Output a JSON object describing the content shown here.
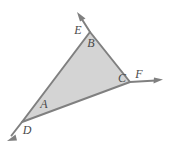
{
  "figure": {
    "type": "geometry-diagram",
    "canvas": {
      "width": 172,
      "height": 149,
      "background": "#ffffff"
    },
    "style": {
      "fill_color": "#d4d4d4",
      "stroke_color": "#808080",
      "label_color": "#4a4a4a",
      "stroke_width": 2
    },
    "triangle": {
      "vertices": [
        {
          "name": "apex",
          "x": 90,
          "y": 32
        },
        {
          "name": "lower-left",
          "x": 22,
          "y": 122
        },
        {
          "name": "right",
          "x": 130,
          "y": 82
        }
      ]
    },
    "rays": [
      {
        "name": "ray-up-through-apex",
        "from_x": 90,
        "from_y": 32,
        "to_x": 78,
        "to_y": 13,
        "arrow": "end"
      },
      {
        "name": "ray-down-left-through-d",
        "from_x": 22,
        "from_y": 122,
        "to_x": 8,
        "to_y": 140,
        "arrow": "end"
      },
      {
        "name": "ray-right-through-f",
        "from_x": 130,
        "from_y": 82,
        "to_x": 162,
        "to_y": 80,
        "arrow": "end"
      }
    ],
    "labels": [
      {
        "key": "E",
        "text": "E",
        "x": 78,
        "y": 31,
        "meaning": "exterior-angle-at-apex"
      },
      {
        "key": "B",
        "text": "B",
        "x": 91,
        "y": 44,
        "meaning": "interior-angle-at-apex"
      },
      {
        "key": "A",
        "text": "A",
        "x": 44,
        "y": 105,
        "meaning": "interior-angle-lower-left"
      },
      {
        "key": "D",
        "text": "D",
        "x": 27,
        "y": 131,
        "meaning": "exterior-angle-lower-left"
      },
      {
        "key": "C",
        "text": "C",
        "x": 122,
        "y": 79,
        "meaning": "interior-angle-right"
      },
      {
        "key": "F",
        "text": "F",
        "x": 139,
        "y": 75,
        "meaning": "exterior-angle-right"
      }
    ]
  }
}
